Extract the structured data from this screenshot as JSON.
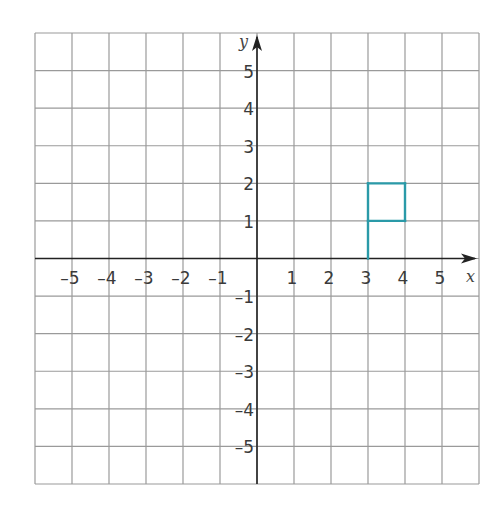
{
  "chart_data": {
    "type": "coordinate-grid",
    "title": "",
    "xlabel": "x",
    "ylabel": "y",
    "xlim": [
      -6,
      6
    ],
    "ylim": [
      -6,
      6
    ],
    "grid": true,
    "x_tick_labels": [
      "–5",
      "–4",
      "–3",
      "–2",
      "–1",
      "1",
      "2",
      "3",
      "4",
      "5"
    ],
    "x_ticks": [
      -5,
      -4,
      -3,
      -2,
      -1,
      1,
      2,
      3,
      4,
      5
    ],
    "y_tick_labels": [
      "5",
      "4",
      "3",
      "2",
      "1",
      "–1",
      "–2",
      "–3",
      "–4",
      "–5"
    ],
    "y_ticks": [
      5,
      4,
      3,
      2,
      1,
      -1,
      -2,
      -3,
      -4,
      -5
    ],
    "shapes": [
      {
        "name": "flag",
        "color": "#2a9aa8",
        "segments": [
          [
            [
              3,
              0
            ],
            [
              3,
              2
            ]
          ],
          [
            [
              3,
              2
            ],
            [
              4,
              2
            ]
          ],
          [
            [
              4,
              2
            ],
            [
              4,
              1
            ]
          ],
          [
            [
              4,
              1
            ],
            [
              3,
              1
            ]
          ]
        ]
      }
    ]
  },
  "style": {
    "grid_color": "#9a9a9a",
    "axis_color": "#222222",
    "shape_color": "#2a9aa8"
  }
}
